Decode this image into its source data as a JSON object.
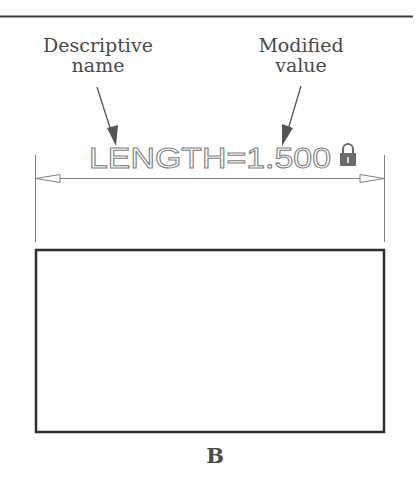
{
  "figure": {
    "callouts": [
      {
        "line1": "Descriptive",
        "line2": "name"
      },
      {
        "line1": "Modified",
        "line2": "value"
      }
    ],
    "dimension": {
      "label": "LENGTH=1.500",
      "lock_icon": "padlock-icon",
      "arrow_style": "open-triangle"
    },
    "caption": "B",
    "colors": {
      "rule": "#3a3a3a",
      "callout_text": "#4a4a4a",
      "dimension": "#808080",
      "lock": "#6b6b6b",
      "rectangle": "#2e2e2e"
    }
  }
}
